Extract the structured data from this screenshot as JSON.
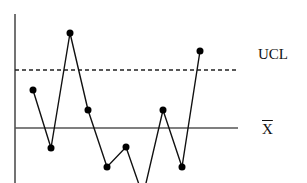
{
  "chart_data": {
    "type": "line",
    "title": "",
    "xlabel": "",
    "ylabel": "",
    "grid": false,
    "legend": "none",
    "reference_lines": [
      {
        "name": "UCL",
        "label": "UCL",
        "style": "dashed",
        "y_px": 70
      },
      {
        "name": "center",
        "label": "X̄",
        "style": "solid",
        "y_px": 128
      }
    ],
    "series": [
      {
        "name": "sample means",
        "points_px": [
          [
            33,
            90
          ],
          [
            51,
            148
          ],
          [
            70,
            33
          ],
          [
            88,
            110
          ],
          [
            107,
            167
          ],
          [
            126,
            147
          ],
          [
            143,
            196
          ],
          [
            163,
            110
          ],
          [
            182,
            167
          ],
          [
            200,
            51
          ]
        ],
        "markers": [
          true,
          true,
          true,
          true,
          true,
          true,
          false,
          true,
          true,
          true
        ]
      }
    ]
  },
  "labels": {
    "ucl": "UCL",
    "xbar": "X"
  },
  "colors": {
    "line": "#111111",
    "axis": "#444444",
    "center": "#555555"
  }
}
